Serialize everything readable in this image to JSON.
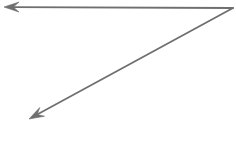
{
  "canvas": {
    "width": 236,
    "height": 142,
    "background_color": "#ffffff",
    "title": "Angle formed by two rays"
  },
  "style": {
    "stroke_color": "#6f6f6f",
    "stroke_color_soft": "#8a8a8a",
    "arrow_fill": "#6f6f6f",
    "stroke_width": 1.8
  },
  "figure": {
    "type": "angle",
    "vertex_label": "",
    "vertex": {
      "x": 233,
      "y": 8
    },
    "rays": [
      {
        "name": "horizontal-ray",
        "from": {
          "x": 233,
          "y": 8
        },
        "to": {
          "x": 6,
          "y": 7
        },
        "direction": "left",
        "arrowhead": "at-end",
        "arrow_tip": {
          "x": 4,
          "y": 7
        },
        "length_px": 227
      },
      {
        "name": "diagonal-ray",
        "from": {
          "x": 233,
          "y": 8
        },
        "to": {
          "x": 32,
          "y": 117
        },
        "direction": "down-left",
        "arrowhead": "at-end",
        "arrow_tip": {
          "x": 29,
          "y": 119
        },
        "length_px": 229
      }
    ],
    "arrowhead": {
      "length_px": 15,
      "half_width_px": 5,
      "fill": "#6f6f6f",
      "shape": "solid-triangle-barbed"
    }
  }
}
